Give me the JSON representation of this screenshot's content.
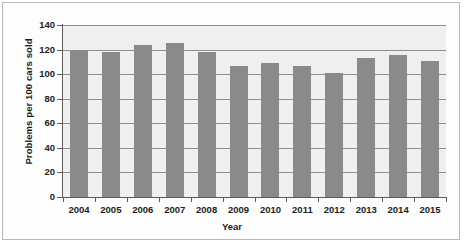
{
  "chart_data": {
    "type": "bar",
    "title": "",
    "xlabel": "Year",
    "ylabel": "Problems per 100 cars sold",
    "categories": [
      "2004",
      "2005",
      "2006",
      "2007",
      "2008",
      "2009",
      "2010",
      "2011",
      "2012",
      "2013",
      "2014",
      "2015"
    ],
    "values": [
      119,
      118,
      124,
      125,
      118,
      107,
      109,
      107,
      101,
      113,
      116,
      111
    ],
    "ylim": [
      0,
      140
    ],
    "yticks": [
      0,
      20,
      40,
      60,
      80,
      100,
      120,
      140
    ],
    "ytick_labels": [
      "0",
      "20",
      "40",
      "60",
      "80",
      "100",
      "120",
      "140"
    ],
    "grid": true,
    "legend": "none",
    "series": [
      {
        "name": "Problems per 100 cars sold",
        "values": [
          119,
          118,
          124,
          125,
          118,
          107,
          109,
          107,
          101,
          113,
          116,
          111
        ]
      }
    ],
    "colors": {
      "bar": "#8a8a8a",
      "plot_background": "#efefef",
      "gridline": "#8e8e8e",
      "axis": "#5c5c5c",
      "text": "#222222",
      "frame": "#b9b9b9",
      "figure_background": "#ffffff"
    }
  }
}
